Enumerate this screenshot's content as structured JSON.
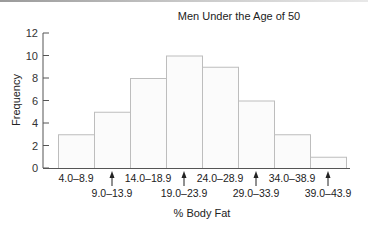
{
  "chart_data": {
    "type": "bar",
    "title": "Men Under the Age of 50",
    "xlabel": "% Body Fat",
    "ylabel": "Frequency",
    "categories": [
      "4.0–8.9",
      "9.0–13.9",
      "14.0–18.9",
      "19.0–23.9",
      "24.0–28.9",
      "29.0–33.9",
      "34.0–38.9",
      "39.0–43.9"
    ],
    "values": [
      3,
      5,
      8,
      10,
      9,
      6,
      3,
      1
    ],
    "ylim": [
      0,
      12
    ],
    "yticks": [
      0,
      2,
      4,
      6,
      8,
      10,
      12
    ],
    "grid": false,
    "legend": null,
    "bar_fill": "#fbfbfb",
    "bar_edge": "#bdbdbd"
  }
}
